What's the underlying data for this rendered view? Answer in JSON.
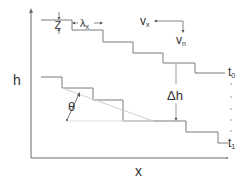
{
  "diagram": {
    "axes": {
      "y_label": "h",
      "x_label": "x"
    },
    "annotations": {
      "step_height": "Z",
      "step_spacing_main": "λ",
      "step_spacing_sub": "x",
      "velocity_x_main": "v",
      "velocity_x_sub": "x",
      "velocity_n_main": "v",
      "velocity_n_sub": "n",
      "delta_h": "Δh",
      "angle": "θ",
      "time_start_main": "t",
      "time_start_sub": "0",
      "time_end_main": "t",
      "time_end_sub": "1"
    },
    "colors": {
      "line": "#7a7a7a",
      "axis": "#6a6a6a",
      "text": "#333333",
      "slope_line": "#cfcfcf"
    }
  }
}
